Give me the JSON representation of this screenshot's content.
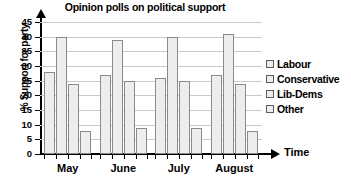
{
  "chart_data": {
    "type": "bar",
    "title": "Opinion polls on political support",
    "xlabel": "Time",
    "ylabel": "% Support for party",
    "categories": [
      "May",
      "June",
      "July",
      "August"
    ],
    "series": [
      {
        "name": "Labour",
        "values": [
          28,
          27,
          26,
          27
        ]
      },
      {
        "name": "Conservative",
        "values": [
          40,
          39,
          40,
          41
        ]
      },
      {
        "name": "Lib-Dems",
        "values": [
          24,
          25,
          25,
          24
        ]
      },
      {
        "name": "Other",
        "values": [
          8,
          9,
          9,
          8
        ]
      }
    ],
    "ylim": [
      0,
      45
    ],
    "ytick_step": 5,
    "yticks": [
      "45",
      "40",
      "35",
      "30",
      "25",
      "20",
      "15",
      "10",
      "5",
      "0"
    ],
    "grid": true,
    "legend_position": "right",
    "bar_fill": "#ededed",
    "bar_border": "#8a8a8a",
    "grid_color": "#c9c9c9",
    "axis_color": "#000000"
  },
  "legend": {
    "items": [
      {
        "label": "Labour"
      },
      {
        "label": "Conservative"
      },
      {
        "label": "Lib-Dems"
      },
      {
        "label": "Other"
      }
    ]
  }
}
